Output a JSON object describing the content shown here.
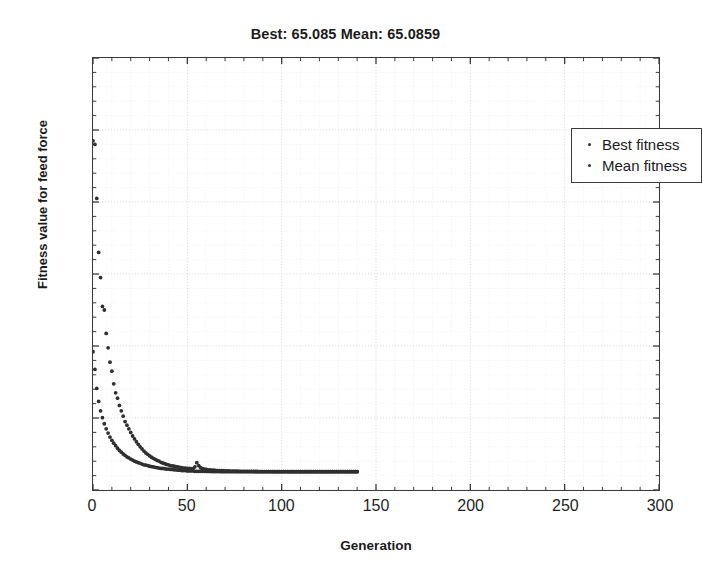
{
  "chart_data": {
    "type": "scatter",
    "title": "Best: 65.085 Mean: 65.0859",
    "xlabel": "Generation",
    "ylabel": "Fitness value for feed force",
    "xlim": [
      0,
      300
    ],
    "ylim": [
      60,
      180
    ],
    "xticks": [
      0,
      50,
      100,
      150,
      200,
      250,
      300
    ],
    "yticks": [
      60,
      80,
      100,
      120,
      140,
      160,
      180
    ],
    "grid": true,
    "grid_style": "dotted",
    "legend_position": "top-right",
    "marker": "dot",
    "marker_color": "#2f2f2f",
    "best_value": 65.085,
    "mean_value": 65.0859,
    "x": [
      0,
      1,
      2,
      3,
      4,
      5,
      6,
      7,
      8,
      9,
      10,
      11,
      12,
      13,
      14,
      15,
      16,
      17,
      18,
      19,
      20,
      21,
      22,
      23,
      24,
      25,
      26,
      27,
      28,
      29,
      30,
      31,
      32,
      33,
      34,
      35,
      36,
      37,
      38,
      39,
      40,
      41,
      42,
      43,
      44,
      45,
      46,
      47,
      48,
      49,
      50,
      51,
      52,
      53,
      54,
      55,
      56,
      57,
      58,
      59,
      60,
      61,
      62,
      63,
      64,
      65,
      66,
      67,
      68,
      69,
      70,
      71,
      72,
      73,
      74,
      75,
      76,
      77,
      78,
      79,
      80,
      81,
      82,
      83,
      84,
      85,
      86,
      87,
      88,
      89,
      90,
      91,
      92,
      93,
      94,
      95,
      96,
      97,
      98,
      99,
      100,
      101,
      102,
      103,
      104,
      105,
      106,
      107,
      108,
      109,
      110,
      111,
      112,
      113,
      114,
      115,
      116,
      117,
      118,
      119,
      120,
      121,
      122,
      123,
      124,
      125,
      126,
      127,
      128,
      129,
      130,
      131,
      132,
      133,
      134,
      135,
      136,
      137,
      138,
      139,
      140
    ],
    "series": [
      {
        "name": "Best fitness",
        "color": "#2f2f2f",
        "values": [
          98.4,
          93.5,
          88.2,
          84.6,
          82.0,
          80.1,
          78.4,
          77.0,
          75.8,
          74.7,
          73.8,
          73.0,
          72.3,
          71.6,
          71.0,
          70.5,
          70.0,
          69.6,
          69.2,
          68.9,
          68.6,
          68.3,
          68.0,
          67.8,
          67.6,
          67.4,
          67.2,
          67.0,
          66.9,
          66.8,
          66.6,
          66.5,
          66.4,
          66.3,
          66.2,
          66.1,
          66.0,
          66.0,
          65.9,
          65.8,
          65.8,
          65.7,
          65.7,
          65.6,
          65.6,
          65.5,
          65.5,
          65.4,
          65.4,
          65.4,
          65.3,
          65.3,
          65.3,
          65.3,
          65.2,
          65.2,
          65.2,
          65.2,
          65.2,
          65.2,
          65.15,
          65.15,
          65.15,
          65.12,
          65.12,
          65.12,
          65.11,
          65.11,
          65.1,
          65.1,
          65.1,
          65.1,
          65.1,
          65.095,
          65.095,
          65.095,
          65.09,
          65.09,
          65.09,
          65.09,
          65.089,
          65.088,
          65.088,
          65.087,
          65.087,
          65.087,
          65.086,
          65.086,
          65.086,
          65.086,
          65.086,
          65.085,
          65.085,
          65.085,
          65.085,
          65.085,
          65.085,
          65.085,
          65.085,
          65.085,
          65.085,
          65.085,
          65.085,
          65.085,
          65.085,
          65.085,
          65.085,
          65.085,
          65.085,
          65.085,
          65.085,
          65.085,
          65.085,
          65.085,
          65.085,
          65.085,
          65.085,
          65.085,
          65.085,
          65.085,
          65.085,
          65.085,
          65.085,
          65.085,
          65.085,
          65.085,
          65.085,
          65.085,
          65.085,
          65.085,
          65.085,
          65.085,
          65.085,
          65.085,
          65.085,
          65.085,
          65.085,
          65.085,
          65.085,
          65.085,
          65.085
        ]
      },
      {
        "name": "Mean fitness",
        "color": "#2f2f2f",
        "values": [
          157.0,
          156.0,
          141.0,
          126.0,
          119.0,
          111.0,
          110.0,
          103.5,
          99.5,
          95.5,
          93.0,
          89.5,
          87.0,
          85.5,
          83.5,
          82.0,
          80.5,
          79.0,
          78.0,
          77.0,
          76.0,
          75.0,
          74.2,
          73.4,
          72.7,
          72.0,
          71.4,
          70.8,
          70.3,
          69.9,
          69.5,
          69.1,
          68.8,
          68.5,
          68.2,
          68.0,
          67.7,
          67.5,
          67.3,
          67.1,
          67.0,
          66.8,
          66.7,
          66.6,
          66.5,
          66.4,
          66.3,
          66.2,
          66.1,
          66.1,
          66.0,
          66.0,
          65.9,
          65.9,
          66.4,
          67.6,
          66.8,
          66.2,
          65.9,
          65.8,
          65.7,
          65.6,
          65.6,
          65.5,
          65.5,
          65.45,
          65.4,
          65.4,
          65.35,
          65.35,
          65.3,
          65.3,
          65.28,
          65.26,
          65.25,
          65.24,
          65.22,
          65.21,
          65.2,
          65.2,
          65.19,
          65.18,
          65.17,
          65.16,
          65.16,
          65.15,
          65.14,
          65.14,
          65.13,
          65.13,
          65.12,
          65.12,
          65.11,
          65.11,
          65.11,
          65.1,
          65.1,
          65.1,
          65.1,
          65.1,
          65.098,
          65.097,
          65.096,
          65.095,
          65.094,
          65.093,
          65.093,
          65.092,
          65.092,
          65.091,
          65.091,
          65.09,
          65.09,
          65.09,
          65.09,
          65.089,
          65.089,
          65.089,
          65.088,
          65.088,
          65.088,
          65.087,
          65.087,
          65.087,
          65.087,
          65.087,
          65.086,
          65.086,
          65.086,
          65.086,
          65.086,
          65.086,
          65.086,
          65.086,
          65.0859,
          65.0859,
          65.0859,
          65.0859,
          65.0859,
          65.0859,
          65.0859
        ]
      }
    ]
  },
  "legend": {
    "items": [
      {
        "label": "Best fitness"
      },
      {
        "label": "Mean fitness"
      }
    ]
  }
}
